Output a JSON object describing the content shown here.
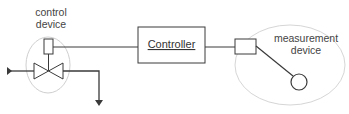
{
  "diagram": {
    "control_device_label": [
      "control",
      "device"
    ],
    "controller_label": "Controller",
    "measurement_device_label": [
      "measurement",
      "device"
    ],
    "colors": {
      "line": "#3a3a3a",
      "ellipse": "#c8c8c8",
      "text": "#444444"
    }
  }
}
